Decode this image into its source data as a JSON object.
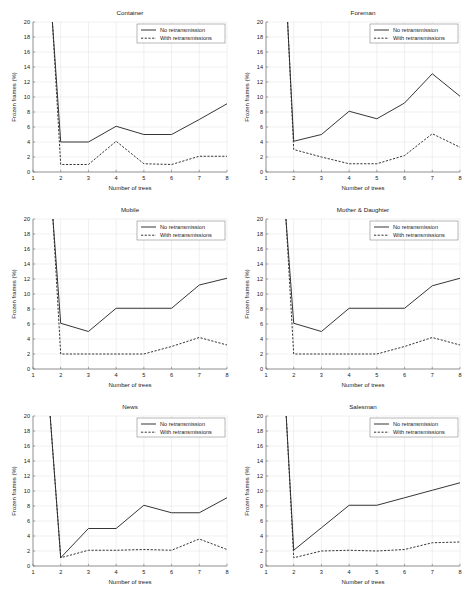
{
  "figure": {
    "layout": "2 columns x 3 rows of line subplots",
    "background": "#ffffff",
    "line_color": "#2b2b2b"
  },
  "legend": {
    "entries": [
      "No retransmission",
      "With retransmissions"
    ],
    "position": "upper right"
  },
  "axes": {
    "xlabel": "Number of trees",
    "ylabel": "Frozen frames (%)",
    "xticks": [
      "1",
      "2",
      "3",
      "4",
      "5",
      "6",
      "7",
      "8"
    ],
    "yticks": [
      "0",
      "2",
      "4",
      "6",
      "8",
      "10",
      "12",
      "14",
      "16",
      "18",
      "20"
    ],
    "xlim": [
      1,
      8
    ],
    "ylim": [
      0,
      20
    ]
  },
  "chart_data": [
    {
      "type": "line",
      "title": "Container",
      "xlabel": "Number of trees",
      "ylabel": "Frozen frames (%)",
      "xlim": [
        1,
        8
      ],
      "ylim": [
        0,
        20
      ],
      "x": [
        1.7,
        2,
        3,
        4,
        5,
        6,
        7,
        8
      ],
      "grid": true,
      "legend_position": "upper right",
      "series": [
        {
          "name": "No retransmission",
          "style": "solid",
          "values": [
            20,
            4.0,
            4.0,
            6.1,
            5.0,
            5.0,
            7.0,
            9.1
          ]
        },
        {
          "name": "With retransmissions",
          "style": "dashed",
          "values": [
            20,
            1.0,
            1.0,
            4.1,
            1.1,
            1.0,
            2.1,
            2.1
          ]
        }
      ]
    },
    {
      "type": "line",
      "title": "Foreman",
      "xlabel": "Number of trees",
      "ylabel": "Frozen frames (%)",
      "xlim": [
        1,
        8
      ],
      "ylim": [
        0,
        20
      ],
      "x": [
        1.78,
        2,
        3,
        4,
        5,
        6,
        7,
        8
      ],
      "grid": true,
      "legend_position": "upper right",
      "series": [
        {
          "name": "No retransmission",
          "style": "solid",
          "values": [
            20,
            4.1,
            5.0,
            8.1,
            7.1,
            9.2,
            13.1,
            10.1
          ]
        },
        {
          "name": "With retransmissions",
          "style": "dashed",
          "values": [
            20,
            3.0,
            2.0,
            1.1,
            1.1,
            2.2,
            5.1,
            3.3
          ]
        }
      ]
    },
    {
      "type": "line",
      "title": "Mobile",
      "xlabel": "Number of trees",
      "ylabel": "Frozen frames (%)",
      "xlim": [
        1,
        8
      ],
      "ylim": [
        0,
        20
      ],
      "x": [
        1.72,
        2,
        3,
        4,
        5,
        6,
        7,
        8
      ],
      "grid": true,
      "legend_position": "upper right",
      "series": [
        {
          "name": "No retransmission",
          "style": "solid",
          "values": [
            20,
            6.1,
            5.0,
            8.1,
            8.1,
            8.1,
            11.2,
            12.1
          ]
        },
        {
          "name": "With retransmissions",
          "style": "dashed",
          "values": [
            20,
            2.0,
            2.0,
            2.0,
            2.0,
            3.0,
            4.2,
            3.2
          ]
        }
      ]
    },
    {
      "type": "line",
      "title": "Mother & Daughter",
      "xlabel": "Number of trees",
      "ylabel": "Frozen frames (%)",
      "xlim": [
        1,
        8
      ],
      "ylim": [
        0,
        20
      ],
      "x": [
        1.72,
        2,
        3,
        4,
        5,
        6,
        7,
        8
      ],
      "grid": true,
      "legend_position": "upper right",
      "series": [
        {
          "name": "No retransmission",
          "style": "solid",
          "values": [
            20,
            6.1,
            5.0,
            8.1,
            8.1,
            8.1,
            11.1,
            12.1
          ]
        },
        {
          "name": "With retransmissions",
          "style": "dashed",
          "values": [
            20,
            2.0,
            2.0,
            2.0,
            2.0,
            3.0,
            4.2,
            3.2
          ]
        }
      ]
    },
    {
      "type": "line",
      "title": "News",
      "xlabel": "Number of trees",
      "ylabel": "Frozen frames (%)",
      "xlim": [
        1,
        8
      ],
      "ylim": [
        0,
        20
      ],
      "x": [
        1.62,
        2,
        3,
        4,
        5,
        6,
        7,
        8
      ],
      "grid": true,
      "legend_position": "upper right",
      "series": [
        {
          "name": "No retransmission",
          "style": "solid",
          "values": [
            20,
            1.1,
            5.0,
            5.0,
            8.1,
            7.1,
            7.1,
            9.1
          ]
        },
        {
          "name": "With retransmissions",
          "style": "dashed",
          "values": [
            20,
            1.1,
            2.1,
            2.1,
            2.2,
            2.1,
            3.6,
            2.2
          ]
        }
      ]
    },
    {
      "type": "line",
      "title": "Salesman",
      "xlabel": "Number of trees",
      "ylabel": "Frozen frames (%)",
      "xlim": [
        1,
        8
      ],
      "ylim": [
        0,
        20
      ],
      "x": [
        1.73,
        2,
        3,
        4,
        5,
        6,
        7,
        8
      ],
      "grid": true,
      "legend_position": "upper right",
      "series": [
        {
          "name": "No retransmission",
          "style": "solid",
          "values": [
            20,
            2.1,
            5.1,
            8.1,
            8.1,
            9.1,
            10.1,
            11.1
          ]
        },
        {
          "name": "With retransmissions",
          "style": "dashed",
          "values": [
            20,
            1.1,
            2.0,
            2.1,
            2.0,
            2.2,
            3.1,
            3.2
          ]
        }
      ]
    }
  ]
}
